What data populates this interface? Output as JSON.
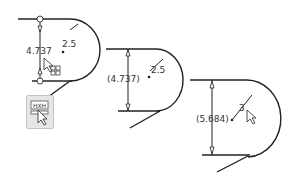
{
  "figure": {
    "panels": [
      {
        "id": "panel-1",
        "dimension_label": "4.737",
        "radius_label": "2.5",
        "state": "driving dimension selected with convert-to-reference toolbar button"
      },
      {
        "id": "panel-2",
        "dimension_label": "(4.737)",
        "radius_label": "2.5",
        "state": "dimension converted to reference (driven)"
      },
      {
        "id": "panel-3",
        "dimension_label": "(5.684)",
        "radius_label": "3",
        "state": "radius changed; reference dimension updated"
      }
    ],
    "toolbar_button": {
      "icon": "reference-dimension-icon"
    },
    "colors": {
      "line": "#222222",
      "text": "#333333",
      "button_bg": "#e6e6e6"
    }
  }
}
